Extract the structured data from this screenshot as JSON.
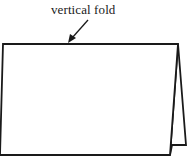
{
  "diagram": {
    "label": "vertical fold",
    "stroke_color": "#1a1a1a",
    "background": "#ffffff"
  }
}
